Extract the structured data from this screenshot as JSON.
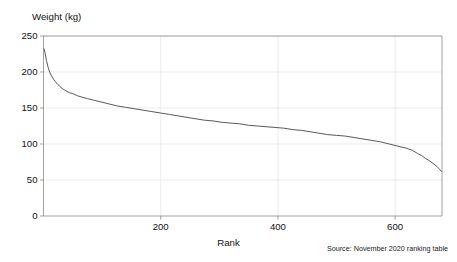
{
  "figure": {
    "cut_off_title": "",
    "background_color": "#ffffff",
    "line_color": "#4f4f4f",
    "grid_color": "#e2e2e2",
    "axis_color": "#8a8a8a"
  },
  "labels": {
    "y_axis_title": "Weight (kg)",
    "x_axis_title": "Rank",
    "source_note": "Source: November 2020 ranking table"
  },
  "chart_data": {
    "type": "line",
    "title": "",
    "subtitle": "",
    "xlabel": "Rank",
    "ylabel": "Weight (kg)",
    "xlim": [
      0,
      680
    ],
    "ylim": [
      0,
      250
    ],
    "xticks": [
      200,
      400,
      600
    ],
    "xtick_labels": [
      "200",
      "400",
      "600"
    ],
    "yticks": [
      0,
      50,
      100,
      150,
      200,
      250
    ],
    "ytick_labels": [
      "0",
      "50",
      "100",
      "150",
      "200",
      "250"
    ],
    "grid": true,
    "grid_axis": "both",
    "legend": false,
    "legend_position": "none",
    "annotations": [
      "Source: November 2020 ranking table"
    ],
    "series": [
      {
        "name": "Weight by rank",
        "color": "#4f4f4f",
        "x": [
          1,
          3,
          5,
          8,
          11,
          14,
          17,
          20,
          24,
          28,
          32,
          36,
          40,
          45,
          50,
          58,
          66,
          75,
          85,
          95,
          105,
          115,
          125,
          140,
          155,
          170,
          185,
          200,
          215,
          230,
          245,
          260,
          275,
          290,
          305,
          320,
          335,
          350,
          365,
          380,
          395,
          410,
          425,
          440,
          455,
          470,
          485,
          500,
          515,
          530,
          545,
          560,
          575,
          590,
          600,
          610,
          620,
          630,
          638,
          645,
          652,
          658,
          663,
          668,
          672,
          676,
          679
        ],
        "y": [
          232,
          225,
          216,
          206,
          199,
          194,
          190,
          187,
          183,
          180,
          177,
          175,
          173,
          171,
          170,
          167,
          165,
          163,
          161,
          159,
          157,
          155,
          153,
          151,
          149,
          147,
          145,
          143,
          141,
          139,
          137,
          135,
          133,
          132,
          130,
          129,
          128,
          126,
          125,
          124,
          123,
          122,
          120,
          119,
          117,
          115,
          113,
          112,
          111,
          109,
          107,
          105,
          103,
          100,
          98,
          96,
          94,
          91,
          87,
          84,
          80,
          77,
          74,
          71,
          68,
          65,
          62
        ]
      }
    ]
  }
}
